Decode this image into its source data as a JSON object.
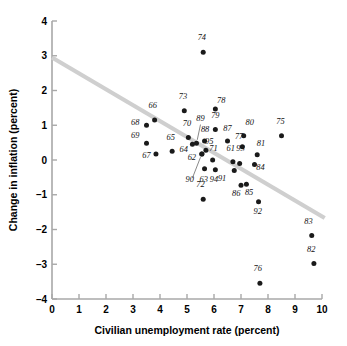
{
  "chart_data": {
    "type": "scatter",
    "title": "",
    "xlabel": "Civilian unemployment rate (percent)",
    "ylabel": "Change in inflation (percent)",
    "xlim": [
      0,
      10
    ],
    "ylim": [
      -4,
      4
    ],
    "xticks": [
      "0",
      "1",
      "2",
      "3",
      "4",
      "5",
      "6",
      "7",
      "8",
      "9",
      "10"
    ],
    "yticks": [
      "4",
      "3",
      "2",
      "1",
      "0",
      "-1",
      "-2",
      "-3",
      "-4"
    ],
    "grid": false,
    "legend": "none",
    "point_color": "#1a1a1a",
    "trend_color": "#cfcfcf",
    "trendline": {
      "x0": 0.0,
      "y0": 2.95,
      "x1": 10.1,
      "y1": -1.67
    },
    "points": [
      {
        "label": "61",
        "x": 6.7,
        "y": -0.05,
        "lx": 6.62,
        "ly": 0.27
      },
      {
        "label": "62",
        "x": 5.55,
        "y": 0.17,
        "lx": 5.18,
        "ly": 0.0
      },
      {
        "label": "63",
        "x": 5.65,
        "y": -0.25,
        "lx": 5.62,
        "ly": -0.62
      },
      {
        "label": "64",
        "x": 5.2,
        "y": 0.45,
        "lx": 4.88,
        "ly": 0.23
      },
      {
        "label": "65",
        "x": 4.45,
        "y": 0.25,
        "lx": 4.4,
        "ly": 0.58
      },
      {
        "label": "66",
        "x": 3.8,
        "y": 1.15,
        "lx": 3.73,
        "ly": 1.5
      },
      {
        "label": "67",
        "x": 3.85,
        "y": 0.17,
        "lx": 3.5,
        "ly": 0.07
      },
      {
        "label": "68",
        "x": 3.5,
        "y": 1.0,
        "lx": 3.08,
        "ly": 1.0
      },
      {
        "label": "69",
        "x": 3.5,
        "y": 0.48,
        "lx": 3.08,
        "ly": 0.62
      },
      {
        "label": "70",
        "x": 5.05,
        "y": 0.65,
        "lx": 5.0,
        "ly": 0.98
      },
      {
        "label": "71",
        "x": 5.95,
        "y": 0.0,
        "lx": 5.98,
        "ly": 0.26
      },
      {
        "label": "72",
        "x": 5.6,
        "y": -1.13,
        "lx": 5.5,
        "ly": -0.78
      },
      {
        "label": "73",
        "x": 4.9,
        "y": 1.42,
        "lx": 4.85,
        "ly": 1.75
      },
      {
        "label": "74",
        "x": 5.6,
        "y": 3.1,
        "lx": 5.55,
        "ly": 3.45
      },
      {
        "label": "75",
        "x": 8.5,
        "y": 0.7,
        "lx": 8.46,
        "ly": 1.03
      },
      {
        "label": "76",
        "x": 7.7,
        "y": -3.55,
        "lx": 7.62,
        "ly": -3.2
      },
      {
        "label": "77",
        "x": 7.05,
        "y": 0.38,
        "lx": 6.93,
        "ly": 0.6
      },
      {
        "label": "78",
        "x": 6.05,
        "y": 1.47,
        "lx": 6.27,
        "ly": 1.63
      },
      {
        "label": "79",
        "x": 6.05,
        "y": 0.88,
        "lx": 6.05,
        "ly": 1.2
      },
      {
        "label": "80",
        "x": 7.1,
        "y": 0.7,
        "lx": 7.32,
        "ly": 1.0
      },
      {
        "label": "81",
        "x": 7.6,
        "y": 0.15,
        "lx": 7.74,
        "ly": 0.4
      },
      {
        "label": "82",
        "x": 9.7,
        "y": -2.98,
        "lx": 9.6,
        "ly": -2.65
      },
      {
        "label": "83",
        "x": 9.62,
        "y": -2.17,
        "lx": 9.5,
        "ly": -1.85
      },
      {
        "label": "84",
        "x": 7.5,
        "y": -0.13,
        "lx": 7.72,
        "ly": -0.3
      },
      {
        "label": "85",
        "x": 7.2,
        "y": -0.7,
        "lx": 7.3,
        "ly": -1.02
      },
      {
        "label": "86",
        "x": 7.0,
        "y": -0.73,
        "lx": 6.82,
        "ly": -1.05
      },
      {
        "label": "87",
        "x": 6.5,
        "y": 0.55,
        "lx": 6.5,
        "ly": 0.83
      },
      {
        "label": "88",
        "x": 5.65,
        "y": 0.55,
        "lx": 5.67,
        "ly": 0.82
      },
      {
        "label": "89",
        "x": 5.35,
        "y": 0.48,
        "lx": 5.5,
        "ly": 1.12
      },
      {
        "label": "90",
        "x": 5.55,
        "y": 0.17,
        "lx": 5.1,
        "ly": -0.62
      },
      {
        "label": "91",
        "x": 6.75,
        "y": -0.3,
        "lx": 6.3,
        "ly": -0.6
      },
      {
        "label": "92",
        "x": 7.65,
        "y": -1.2,
        "lx": 7.62,
        "ly": -1.55
      },
      {
        "label": "93",
        "x": 6.95,
        "y": -0.1,
        "lx": 6.98,
        "ly": 0.25
      },
      {
        "label": "94",
        "x": 6.05,
        "y": -0.28,
        "lx": 6.0,
        "ly": -0.62
      },
      {
        "label": "95",
        "x": 5.7,
        "y": 0.28,
        "lx": 5.82,
        "ly": 0.45
      }
    ],
    "leaders": [
      {
        "x1": 5.5,
        "y1": 1.02,
        "x2": 5.38,
        "y2": 0.58
      },
      {
        "x1": 5.2,
        "y1": -0.52,
        "x2": 5.5,
        "y2": 0.08
      }
    ]
  }
}
